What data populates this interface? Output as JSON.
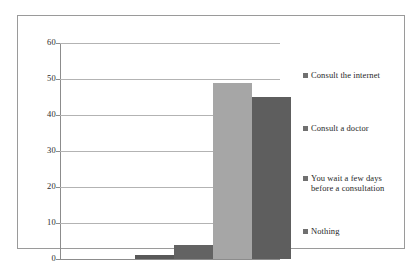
{
  "chart_data": {
    "type": "bar",
    "title": "",
    "subtitle": "",
    "xlabel": "",
    "ylabel": "",
    "ylim": [
      0,
      60
    ],
    "ytick_step": 10,
    "ytick_labels": [
      "60",
      "50",
      "40",
      "30",
      "20",
      "10",
      "0"
    ],
    "ytick_values": [
      60,
      50,
      40,
      30,
      20,
      10,
      0
    ],
    "grid": true,
    "legend_position": "right",
    "categories": [
      "Consult the internet",
      "Consult a doctor",
      "You wait a few days before a consultation",
      "Nothing"
    ],
    "values": [
      1,
      4,
      49,
      45
    ],
    "colors": [
      "#595959",
      "#636363",
      "#a6a6a6",
      "#5e5e5e"
    ],
    "legend": [
      {
        "label": "Consult the internet",
        "color": "#707070"
      },
      {
        "label": "Consult a doctor",
        "color": "#707070"
      },
      {
        "label": "You wait a few days before a consultation",
        "color": "#707070"
      },
      {
        "label": "Nothing",
        "color": "#707070"
      }
    ]
  },
  "legend_lines": [
    [
      "Consult the internet"
    ],
    [
      "Consult a doctor"
    ],
    [
      "You wait a few days",
      "before a consultation"
    ],
    [
      "Nothing"
    ]
  ],
  "style": {
    "frame_color": "#9a9a9a",
    "gridline_color": "#b3b3b3",
    "axis_color": "#8c8c8c",
    "text_color": "#1f1f1f",
    "background": "#ffffff"
  }
}
